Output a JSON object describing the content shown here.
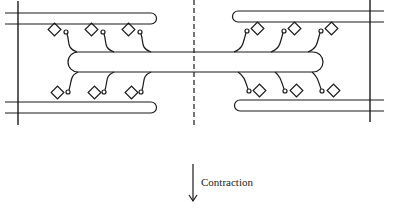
{
  "diagram": {
    "type": "sarcomere-sliding-filament",
    "colors": {
      "stroke": "#1a1a1a",
      "background": "#ffffff"
    },
    "annotation": {
      "label": "Contraction",
      "direction": "down"
    },
    "elements": {
      "z_lines": 2,
      "m_line": "dashed center line",
      "thin_filaments": 4,
      "thick_filament": 1,
      "myosin_heads": 12
    }
  }
}
